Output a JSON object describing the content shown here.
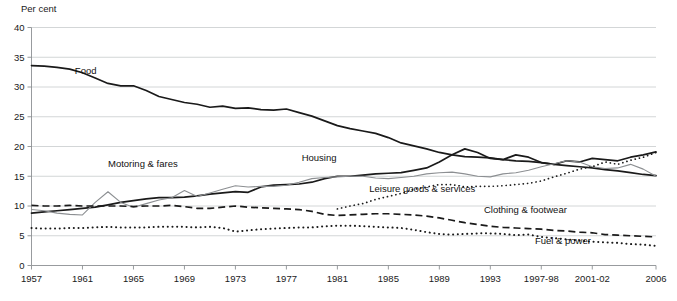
{
  "chart_data": {
    "type": "line",
    "title": "",
    "ylabel": "Per cent",
    "xlabel": "",
    "ylim": [
      0,
      40
    ],
    "ytick_step": 5,
    "yticks": [
      0,
      5,
      10,
      15,
      20,
      25,
      30,
      35,
      40
    ],
    "grid": true,
    "legend": "inline-labels",
    "x": [
      1957,
      1958,
      1959,
      1960,
      1961,
      1962,
      1963,
      1964,
      1965,
      1966,
      1967,
      1968,
      1969,
      1970,
      1971,
      1972,
      1973,
      1974,
      1975,
      1976,
      1977,
      1978,
      1979,
      1980,
      1981,
      1982,
      1983,
      1984,
      1985,
      1986,
      1987,
      1988,
      1989,
      1990,
      1991,
      1992,
      1993,
      1994,
      1995,
      1996,
      1997,
      1998,
      1999,
      2000,
      2001,
      2002,
      2003,
      2004,
      2005,
      2006
    ],
    "xticks": [
      {
        "value": 1957,
        "label": "1957"
      },
      {
        "value": 1961,
        "label": "1961"
      },
      {
        "value": 1965,
        "label": "1965"
      },
      {
        "value": 1969,
        "label": "1969"
      },
      {
        "value": 1973,
        "label": "1973"
      },
      {
        "value": 1977,
        "label": "1977"
      },
      {
        "value": 1981,
        "label": "1981"
      },
      {
        "value": 1985,
        "label": "1985"
      },
      {
        "value": 1989,
        "label": "1989"
      },
      {
        "value": 1993,
        "label": "1993"
      },
      {
        "value": 1997,
        "label": "1997-98"
      },
      {
        "value": 2001,
        "label": "2001-02"
      },
      {
        "value": 2006,
        "label": "2006"
      }
    ],
    "series": [
      {
        "name": "Food",
        "label": "Food",
        "style": "solid",
        "color": "#1a1a1a",
        "width": 1.7,
        "label_x": 1960.4,
        "label_y": 32.2,
        "values": [
          33.6,
          33.5,
          33.3,
          33.0,
          32.4,
          31.5,
          30.6,
          30.2,
          30.2,
          29.4,
          28.4,
          27.9,
          27.4,
          27.1,
          26.6,
          26.8,
          26.4,
          26.5,
          26.2,
          26.1,
          26.3,
          25.7,
          25.1,
          24.3,
          23.5,
          23.0,
          22.6,
          22.2,
          21.5,
          20.6,
          20.1,
          19.6,
          19.0,
          18.6,
          18.3,
          18.2,
          18.1,
          17.8,
          17.6,
          17.5,
          17.3,
          17.0,
          16.8,
          16.6,
          16.4,
          16.1,
          15.9,
          15.6,
          15.3,
          15.1
        ]
      },
      {
        "name": "Housing",
        "label": "Housing",
        "style": "solid",
        "color": "#1a1a1a",
        "width": 1.7,
        "label_x": 1978.2,
        "label_y": 17.6,
        "values": [
          8.8,
          9.0,
          9.2,
          9.4,
          9.6,
          9.8,
          10.2,
          10.6,
          10.9,
          11.2,
          11.4,
          11.4,
          11.5,
          11.7,
          12.0,
          12.2,
          12.4,
          12.3,
          13.2,
          13.5,
          13.6,
          13.7,
          14.0,
          14.6,
          15.0,
          15.0,
          15.2,
          15.4,
          15.5,
          15.6,
          16.0,
          16.4,
          17.4,
          18.6,
          19.6,
          19.0,
          18.0,
          17.8,
          18.6,
          18.2,
          17.3,
          17.0,
          17.6,
          17.4,
          18.0,
          17.8,
          17.6,
          18.2,
          18.6,
          19.1
        ]
      },
      {
        "name": "Motoring & fares",
        "label": "Motoring & fares",
        "style": "solid",
        "color": "#8c8f92",
        "width": 1.1,
        "label_x": 1963.0,
        "label_y": 16.5,
        "values": [
          9.4,
          9.2,
          8.8,
          8.6,
          8.5,
          10.6,
          12.4,
          10.6,
          9.8,
          10.4,
          11.0,
          11.4,
          12.6,
          11.6,
          12.2,
          12.8,
          13.4,
          13.2,
          13.3,
          13.3,
          13.5,
          14.0,
          14.6,
          14.8,
          14.9,
          15.0,
          15.0,
          14.7,
          14.6,
          14.8,
          15.0,
          15.4,
          15.6,
          15.7,
          15.4,
          15.0,
          14.9,
          15.4,
          15.6,
          16.0,
          16.6,
          17.1,
          17.6,
          17.4,
          16.6,
          16.3,
          16.4,
          17.0,
          16.2,
          15.0
        ]
      },
      {
        "name": "Leisure goods & services",
        "label": "Leisure goods & services",
        "style": "dotted-fine",
        "color": "#1a1a1a",
        "width": 1.7,
        "label_x": 1983.5,
        "label_y": 12.4,
        "values": [
          null,
          null,
          null,
          null,
          null,
          null,
          null,
          null,
          null,
          null,
          null,
          null,
          null,
          null,
          null,
          null,
          null,
          null,
          null,
          null,
          null,
          null,
          null,
          null,
          9.5,
          10.0,
          10.4,
          11.1,
          11.6,
          12.1,
          12.8,
          13.2,
          13.6,
          13.6,
          13.2,
          13.3,
          13.3,
          13.4,
          13.6,
          13.8,
          14.2,
          14.9,
          15.5,
          16.2,
          16.6,
          17.4,
          17.0,
          17.7,
          18.2,
          19.0
        ]
      },
      {
        "name": "Clothing & footwear",
        "label": "Clothing & footwear",
        "style": "dashed",
        "color": "#1a1a1a",
        "width": 1.7,
        "label_x": 1992.5,
        "label_y": 8.9,
        "values": [
          10.1,
          10.0,
          10.0,
          10.1,
          10.0,
          10.0,
          10.0,
          10.0,
          9.9,
          10.0,
          10.0,
          10.1,
          9.9,
          9.6,
          9.6,
          9.8,
          10.0,
          9.8,
          9.7,
          9.6,
          9.5,
          9.4,
          9.1,
          8.6,
          8.4,
          8.5,
          8.6,
          8.7,
          8.7,
          8.6,
          8.5,
          8.3,
          8.0,
          7.6,
          7.2,
          6.9,
          6.6,
          6.4,
          6.3,
          6.2,
          6.1,
          5.9,
          5.8,
          5.6,
          5.5,
          5.2,
          5.1,
          5.0,
          4.9,
          4.8
        ]
      },
      {
        "name": "Fuel & power",
        "label": "Fuel & power",
        "style": "dotted-round",
        "color": "#1a1a1a",
        "width": 2.0,
        "label_x": 1996.5,
        "label_y": 3.6,
        "values": [
          6.3,
          6.2,
          6.2,
          6.3,
          6.3,
          6.4,
          6.5,
          6.4,
          6.4,
          6.4,
          6.5,
          6.5,
          6.5,
          6.4,
          6.5,
          6.3,
          5.7,
          5.9,
          6.1,
          6.2,
          6.3,
          6.4,
          6.4,
          6.6,
          6.7,
          6.7,
          6.6,
          6.5,
          6.4,
          6.3,
          6.0,
          5.6,
          5.3,
          5.2,
          5.3,
          5.4,
          5.4,
          5.3,
          5.1,
          5.2,
          4.8,
          4.6,
          4.4,
          4.2,
          4.0,
          3.9,
          3.8,
          3.6,
          3.5,
          3.3
        ]
      }
    ]
  }
}
